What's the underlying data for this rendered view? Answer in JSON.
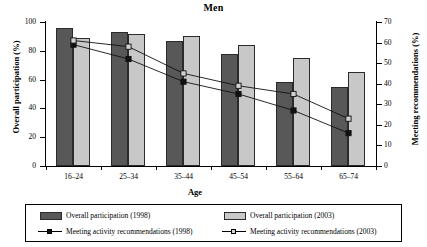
{
  "chart_data": {
    "type": "bar",
    "title": "Men",
    "xlabel": "Age",
    "ylabel": "Overall  participation (%)",
    "ylabel_right": "Meeting recommendations (%)",
    "categories": [
      "16–24",
      "25–34",
      "35–44",
      "45–54",
      "55–64",
      "65–74"
    ],
    "ylim": [
      0,
      100
    ],
    "ylim_right": [
      0,
      70
    ],
    "yticks": [
      0,
      20,
      40,
      60,
      80,
      100
    ],
    "yticks_right": [
      0,
      10,
      20,
      30,
      40,
      50,
      60,
      70
    ],
    "grid": false,
    "legend_position": "bottom",
    "series": [
      {
        "name": "Overall participation (1998)",
        "kind": "bar",
        "axis": "left",
        "color": "#585858",
        "values": [
          96,
          93,
          87,
          78,
          58,
          55
        ]
      },
      {
        "name": "Overall participation (2003)",
        "kind": "bar",
        "axis": "left",
        "color": "#c8c8c8",
        "values": [
          89,
          92,
          90,
          84,
          75,
          65
        ]
      },
      {
        "name": "Meeting activity recommendations (1998)",
        "kind": "line",
        "axis": "right",
        "marker": "filled-square",
        "color": "#111111",
        "values": [
          59,
          52,
          41,
          35,
          27,
          16
        ]
      },
      {
        "name": "Meeting activity recommendations (2003)",
        "kind": "line",
        "axis": "right",
        "marker": "open-square",
        "color": "#111111",
        "values": [
          61,
          58,
          45,
          39,
          35,
          23
        ]
      }
    ]
  },
  "legend": {
    "entries": [
      {
        "label": "Overall participation (1998)",
        "swatch": "dark-square-swatch"
      },
      {
        "label": "Overall participation (2003)",
        "swatch": "light-square-swatch"
      },
      {
        "label": "Meeting activity recommendations (1998)",
        "swatch": "line-filled-marker"
      },
      {
        "label": "Meeting activity recommendations (2003)",
        "swatch": "line-open-marker"
      }
    ]
  }
}
